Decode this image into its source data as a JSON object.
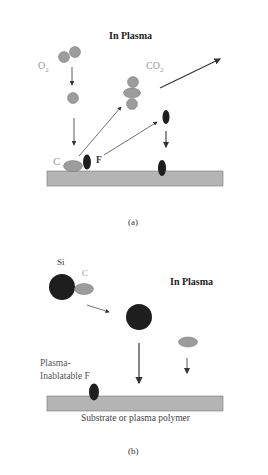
{
  "panel_a": {
    "title": "In Plasma",
    "o2_label": "O",
    "o2_sub": "2",
    "co2_label": "CO",
    "co2_sub": "2",
    "c_label": "C",
    "f_label": "F",
    "caption": "(a)"
  },
  "panel_b": {
    "title": "In Plasma",
    "si_label": "Si",
    "c_label": "C",
    "f_label_line1": "Plasma-",
    "f_label_line2": "Inablatable F",
    "substrate_label": "Substrate or plasma polymer",
    "caption": "(b)"
  },
  "colors": {
    "light_atom": "#9c9c9c",
    "dark_atom": "#1e1e1e",
    "substrate": "#b4b4b4",
    "arrow": "#333333"
  }
}
